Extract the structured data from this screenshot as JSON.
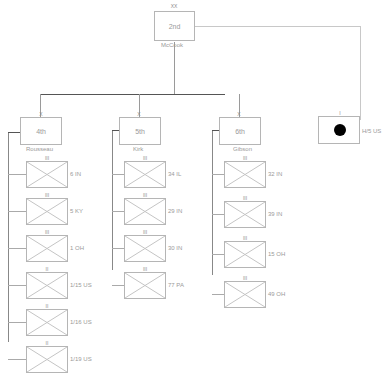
{
  "division": {
    "echelon": "XX",
    "name": "2nd",
    "commander": "McCook"
  },
  "attached": {
    "echelon": "I",
    "name": "H/5 US",
    "symbol": "filled-circle"
  },
  "brigades": [
    {
      "echelon": "X",
      "name": "4th",
      "commander": "Rousseau",
      "units": [
        {
          "echelon": "III",
          "name": "6 IN"
        },
        {
          "echelon": "III",
          "name": "5 KY"
        },
        {
          "echelon": "III",
          "name": "1 OH"
        },
        {
          "echelon": "II",
          "name": "1/15 US"
        },
        {
          "echelon": "II",
          "name": "1/16 US"
        },
        {
          "echelon": "II",
          "name": "1/19 US"
        }
      ]
    },
    {
      "echelon": "X",
      "name": "5th",
      "commander": "Kirk",
      "units": [
        {
          "echelon": "III",
          "name": "34 IL"
        },
        {
          "echelon": "III",
          "name": "29 IN"
        },
        {
          "echelon": "III",
          "name": "30 IN"
        },
        {
          "echelon": "III",
          "name": "77 PA"
        }
      ]
    },
    {
      "echelon": "X",
      "name": "6th",
      "commander": "Gibson",
      "units": [
        {
          "echelon": "III",
          "name": "32 IN"
        },
        {
          "echelon": "III",
          "name": "39 IN"
        },
        {
          "echelon": "III",
          "name": "15 OH"
        },
        {
          "echelon": "III",
          "name": "49 OH"
        }
      ]
    }
  ]
}
